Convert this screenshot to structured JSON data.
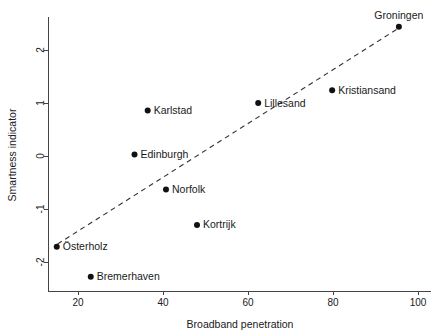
{
  "chart_data": {
    "type": "scatter",
    "title": "",
    "xlabel": "Broadband penetration",
    "ylabel": "Smartness indicator",
    "xlim": [
      13,
      103
    ],
    "ylim": [
      -2.55,
      2.62
    ],
    "xticks": [
      20,
      40,
      60,
      80,
      100
    ],
    "xtick_labels": [
      "20",
      "40",
      "60",
      "80",
      "100"
    ],
    "yticks": [
      2,
      1,
      0,
      -1,
      -2
    ],
    "ytick_labels": [
      "2",
      "1",
      "0",
      "-1",
      "-2"
    ],
    "grid": false,
    "legend": "none",
    "points": [
      {
        "label": "Groningen",
        "x": 95.5,
        "y": 2.44,
        "label_pos": "above"
      },
      {
        "label": "Kristiansand",
        "x": 79.8,
        "y": 1.24,
        "label_pos": "right"
      },
      {
        "label": "Lillesand",
        "x": 62.4,
        "y": 1.0,
        "label_pos": "right"
      },
      {
        "label": "Karlstad",
        "x": 36.4,
        "y": 0.86,
        "label_pos": "right"
      },
      {
        "label": "Edinburgh",
        "x": 33.3,
        "y": 0.03,
        "label_pos": "right"
      },
      {
        "label": "Norfolk",
        "x": 40.7,
        "y": -0.63,
        "label_pos": "right"
      },
      {
        "label": "Kortrijk",
        "x": 48.0,
        "y": -1.3,
        "label_pos": "right"
      },
      {
        "label": "Österholz",
        "x": 15.0,
        "y": -1.71,
        "label_pos": "right"
      },
      {
        "label": "Bremerhaven",
        "x": 23.0,
        "y": -2.28,
        "label_pos": "right"
      }
    ],
    "trendline": {
      "style": "dashed",
      "x0": 15.2,
      "y0": -1.66,
      "x1": 95.8,
      "y1": 2.43
    },
    "colors": {
      "point": "#111111",
      "axis": "#444444",
      "trend": "#333333",
      "text": "#1a1a1a",
      "background": "#ffffff"
    }
  }
}
